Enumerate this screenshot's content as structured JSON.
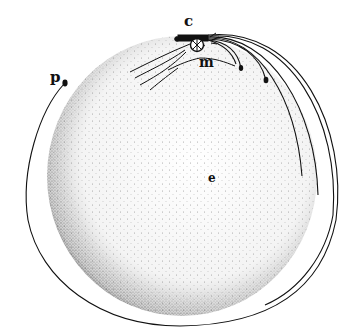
{
  "figure": {
    "labels": {
      "cannon": "c",
      "mountain": "m",
      "projectile": "p",
      "earth_center": "e"
    },
    "colors": {
      "ink": "#111111",
      "background": "#ffffff"
    },
    "elements": {
      "earth": "stippled sphere",
      "mountain": "mountain top with cannon",
      "trajectories": [
        "short fall near mountain",
        "fall landing near m",
        "fall landing further",
        "long arc to right side",
        "longer arc to right side",
        "near-orbit arc",
        "orbit wrapping around to p"
      ]
    }
  }
}
